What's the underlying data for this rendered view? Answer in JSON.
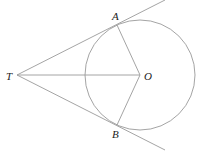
{
  "diagram": {
    "colors": {
      "line": "#9a9a9a",
      "label": "#222222",
      "background": "#ffffff"
    },
    "points": {
      "T": {
        "label": "T",
        "x": 17,
        "y": 75
      },
      "O": {
        "label": "O",
        "x": 140,
        "y": 75
      },
      "A": {
        "label": "A",
        "x": 117,
        "y": 25
      },
      "B": {
        "label": "B",
        "x": 117,
        "y": 125
      }
    },
    "circle": {
      "center": "O",
      "radius": 55
    },
    "segments": [
      {
        "from": "T",
        "to": "A",
        "extended": true
      },
      {
        "from": "T",
        "to": "B",
        "extended": true
      },
      {
        "from": "T",
        "to": "O"
      },
      {
        "from": "O",
        "to": "A"
      },
      {
        "from": "O",
        "to": "B"
      }
    ]
  }
}
